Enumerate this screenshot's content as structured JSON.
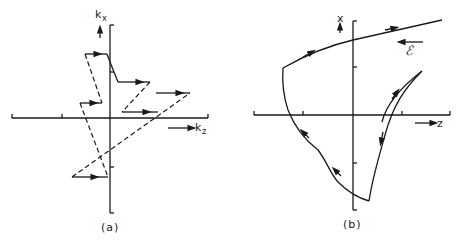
{
  "figure": {
    "panel_a": {
      "caption": "(a)",
      "y_axis_label": "k",
      "y_axis_subscript": "x",
      "x_axis_label": "k",
      "x_axis_subscript": "z",
      "description": "Zig-zag trajectory in k-space: solid horizontal segments with rightward arrows joined by dashed jumps"
    },
    "panel_b": {
      "caption": "(b)",
      "y_axis_label": "x",
      "x_axis_label": "z",
      "field_label": "ℰ",
      "field_direction": "left",
      "description": "Real-space trajectory with arrows showing direction of motion under field"
    },
    "colors": {
      "ink": "#1a1a1a",
      "background": "#ffffff"
    }
  }
}
